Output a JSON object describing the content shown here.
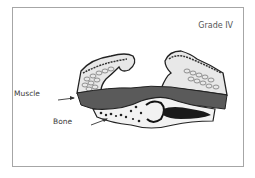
{
  "figure": {
    "title": "Grade IV",
    "labels": {
      "muscle": "Muscle",
      "bone": "Bone"
    },
    "colors": {
      "frame_border": "#a6a6a6",
      "muscle_fill": "#5a5a5a",
      "skin_outline": "#222222",
      "text": "#3a3a3a"
    }
  }
}
